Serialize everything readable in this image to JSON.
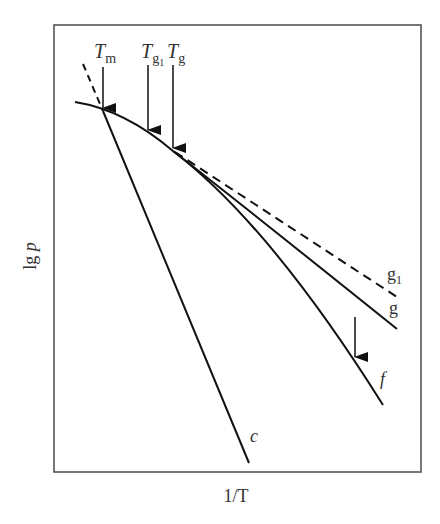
{
  "diagram": {
    "xlabel": "1/T",
    "ylabel_main": "lg",
    "ylabel_var": "p",
    "markers": [
      {
        "id": "Tm",
        "base": "T",
        "sub": "m",
        "x": 103
      },
      {
        "id": "Tg1",
        "base": "T",
        "sub": "g",
        "subsub": "1",
        "x": 148
      },
      {
        "id": "Tg",
        "base": "T",
        "sub": "g",
        "x": 173
      }
    ],
    "curves": [
      {
        "id": "c",
        "label": "c",
        "style": "solid"
      },
      {
        "id": "f",
        "label": "f",
        "style": "solid"
      },
      {
        "id": "g",
        "label": "g",
        "style": "solid"
      },
      {
        "id": "g1",
        "label": "g",
        "label_sub": "1",
        "style": "dashed"
      }
    ],
    "colors": {
      "line": "#111111",
      "frame": "#555555",
      "text": "#333333"
    }
  }
}
